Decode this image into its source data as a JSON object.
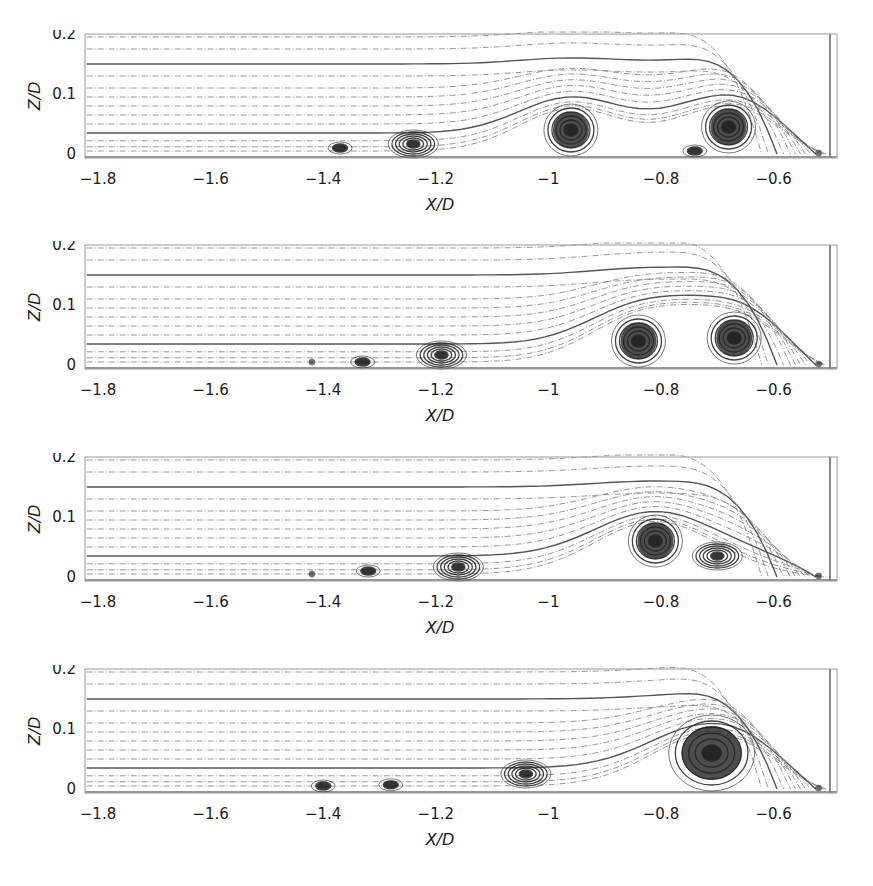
{
  "chart_data": [
    {
      "type": "streamline",
      "panel": 1,
      "xlabel": "X/D",
      "ylabel": "Z/D",
      "xlim": [
        -1.82,
        -0.5
      ],
      "ylim": [
        -0.01,
        0.2
      ],
      "xticks": [
        "-1.8",
        "-1.6",
        "-1.4",
        "-1.2",
        "-1",
        "-0.8",
        "-0.6"
      ],
      "yticks": [
        "0",
        "0.1",
        "0.2"
      ],
      "vortices": [
        {
          "x": -1.37,
          "z": 0.01,
          "size": "small"
        },
        {
          "x": -1.24,
          "z": 0.015,
          "size": "medium"
        },
        {
          "x": -0.96,
          "z": 0.04,
          "size": "large"
        },
        {
          "x": -0.74,
          "z": 0.005,
          "size": "small"
        },
        {
          "x": -0.68,
          "z": 0.045,
          "size": "large"
        },
        {
          "x": -0.52,
          "z": 0.0,
          "size": "tiny"
        }
      ]
    },
    {
      "type": "streamline",
      "panel": 2,
      "xlabel": "X/D",
      "ylabel": "Z/D",
      "xlim": [
        -1.82,
        -0.5
      ],
      "ylim": [
        -0.01,
        0.2
      ],
      "xticks": [
        "-1.8",
        "-1.6",
        "-1.4",
        "-1.2",
        "-1",
        "-0.8",
        "-0.6"
      ],
      "yticks": [
        "0",
        "0.1",
        "0.2"
      ],
      "vortices": [
        {
          "x": -1.42,
          "z": 0.005,
          "size": "tiny"
        },
        {
          "x": -1.33,
          "z": 0.005,
          "size": "small"
        },
        {
          "x": -1.19,
          "z": 0.01,
          "size": "medium"
        },
        {
          "x": -0.84,
          "z": 0.04,
          "size": "large"
        },
        {
          "x": -0.67,
          "z": 0.045,
          "size": "large"
        },
        {
          "x": -0.52,
          "z": 0.0,
          "size": "tiny"
        }
      ]
    },
    {
      "type": "streamline",
      "panel": 3,
      "xlabel": "X/D",
      "ylabel": "Z/D",
      "xlim": [
        -1.82,
        -0.5
      ],
      "ylim": [
        -0.01,
        0.2
      ],
      "xticks": [
        "-1.8",
        "-1.6",
        "-1.4",
        "-1.2",
        "-1",
        "-0.8",
        "-0.6"
      ],
      "yticks": [
        "0",
        "0.1",
        "0.2"
      ],
      "vortices": [
        {
          "x": -1.42,
          "z": 0.005,
          "size": "tiny"
        },
        {
          "x": -1.32,
          "z": 0.01,
          "size": "small"
        },
        {
          "x": -1.16,
          "z": 0.015,
          "size": "medium"
        },
        {
          "x": -0.81,
          "z": 0.06,
          "size": "large"
        },
        {
          "x": -0.7,
          "z": 0.035,
          "size": "medium"
        },
        {
          "x": -0.52,
          "z": 0.0,
          "size": "tiny"
        }
      ]
    },
    {
      "type": "streamline",
      "panel": 4,
      "xlabel": "X/D",
      "ylabel": "Z/D",
      "xlim": [
        -1.82,
        -0.5
      ],
      "ylim": [
        -0.01,
        0.2
      ],
      "xticks": [
        "-1.8",
        "-1.6",
        "-1.4",
        "-1.2",
        "-1",
        "-0.8",
        "-0.6"
      ],
      "yticks": [
        "0",
        "0.1",
        "0.2"
      ],
      "vortices": [
        {
          "x": -1.4,
          "z": 0.005,
          "size": "small"
        },
        {
          "x": -1.28,
          "z": 0.007,
          "size": "small"
        },
        {
          "x": -1.04,
          "z": 0.025,
          "size": "medium"
        },
        {
          "x": -0.71,
          "z": 0.06,
          "size": "xlarge"
        },
        {
          "x": -0.52,
          "z": 0.0,
          "size": "tiny"
        }
      ]
    }
  ],
  "panels": [
    {
      "xlabel": "X/D",
      "ylabel": "Z/D",
      "xticks": [
        "−1.8",
        "−1.6",
        "−1.4",
        "−1.2",
        "−1",
        "−0.8",
        "−0.6"
      ],
      "yticks": [
        "0",
        "0.1",
        "0.2"
      ]
    },
    {
      "xlabel": "X/D",
      "ylabel": "Z/D",
      "xticks": [
        "−1.8",
        "−1.6",
        "−1.4",
        "−1.2",
        "−1",
        "−0.8",
        "−0.6"
      ],
      "yticks": [
        "0",
        "0.1",
        "0.2"
      ]
    },
    {
      "xlabel": "X/D",
      "ylabel": "Z/D",
      "xticks": [
        "−1.8",
        "−1.6",
        "−1.4",
        "−1.2",
        "−1",
        "−0.8",
        "−0.6"
      ],
      "yticks": [
        "0",
        "0.1",
        "0.2"
      ]
    },
    {
      "xlabel": "X/D",
      "ylabel": "Z/D",
      "xticks": [
        "−1.8",
        "−1.6",
        "−1.4",
        "−1.2",
        "−1",
        "−0.8",
        "−0.6"
      ],
      "yticks": [
        "0",
        "0.1",
        "0.2"
      ]
    }
  ],
  "colors": {
    "ink": "#1a1a1a",
    "streamline": "#8a8a8a",
    "vortex": "#111111"
  }
}
